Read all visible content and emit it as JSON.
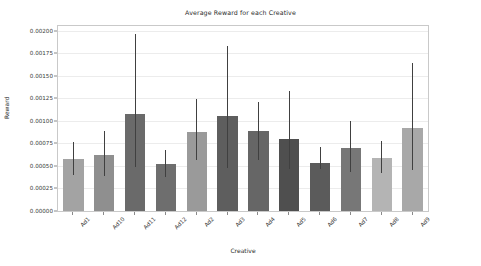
{
  "chart_data": {
    "type": "bar",
    "title": "Average Reward for each Creative",
    "xlabel": "Creative",
    "ylabel": "Reward",
    "grid": true,
    "legend": "none",
    "categories": [
      "Ad1",
      "Ad10",
      "Ad11",
      "Ad12",
      "Ad2",
      "Ad3",
      "Ad4",
      "Ad5",
      "Ad6",
      "Ad7",
      "Ad8",
      "Ad9"
    ],
    "values": [
      0.00058,
      0.00062,
      0.00108,
      0.00052,
      0.00088,
      0.00105,
      0.00089,
      0.0008,
      0.00053,
      0.0007,
      0.00059,
      0.00092
    ],
    "error_low": [
      0.0004,
      0.00039,
      0.00049,
      0.00038,
      0.00057,
      0.00048,
      0.00057,
      0.00046,
      0.00046,
      0.00043,
      0.00042,
      0.00045
    ],
    "error_high": [
      0.00076,
      0.00089,
      0.00196,
      0.00068,
      0.00124,
      0.00183,
      0.00121,
      0.00133,
      0.00071,
      0.001,
      0.00078,
      0.00164
    ],
    "bar_colors": [
      "#a3a3a3",
      "#8f8f8f",
      "#6a6a6a",
      "#6e6e6e",
      "#9a9a9a",
      "#5e5e5e",
      "#666666",
      "#4f4f4f",
      "#5b5b5b",
      "#777777",
      "#b4b4b4",
      "#a8a8a8"
    ],
    "error_color": "#404040",
    "ylim": [
      0.0,
      0.00205
    ],
    "yticks": [
      "0.00000",
      "0.00025",
      "0.00050",
      "0.00075",
      "0.00100",
      "0.00125",
      "0.00150",
      "0.00175",
      "0.00200"
    ],
    "ytick_values": [
      0.0,
      0.00025,
      0.0005,
      0.00075,
      0.001,
      0.00125,
      0.0015,
      0.00175,
      0.002
    ]
  }
}
